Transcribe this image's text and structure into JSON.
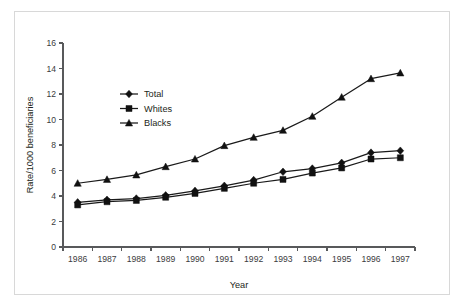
{
  "chart_data": {
    "type": "line",
    "title": "",
    "xlabel": "Year",
    "ylabel": "Rate/1000 beneficiaries",
    "categories": [
      "1986",
      "1987",
      "1988",
      "1989",
      "1990",
      "1991",
      "1992",
      "1993",
      "1994",
      "1995",
      "1996",
      "1997"
    ],
    "x": [
      1986,
      1987,
      1988,
      1989,
      1990,
      1991,
      1992,
      1993,
      1994,
      1995,
      1996,
      1997
    ],
    "xlim": [
      1985.5,
      1997.5
    ],
    "ylim": [
      0,
      16
    ],
    "yticks": [
      0,
      2,
      4,
      6,
      8,
      10,
      12,
      14,
      16
    ],
    "ytick_labels": [
      "0",
      "2",
      "4",
      "6",
      "8",
      "10",
      "12",
      "14",
      "16"
    ],
    "grid": false,
    "legend_position": "upper-left-inside",
    "series": [
      {
        "name": "Total",
        "marker": "diamond",
        "color": "#111111",
        "values": [
          3.5,
          3.7,
          3.8,
          4.05,
          4.4,
          4.8,
          5.25,
          5.9,
          6.15,
          6.6,
          7.4,
          7.55
        ]
      },
      {
        "name": "Whites",
        "marker": "square",
        "color": "#111111",
        "values": [
          3.3,
          3.55,
          3.65,
          3.9,
          4.2,
          4.6,
          5.0,
          5.3,
          5.8,
          6.2,
          6.9,
          7.0
        ]
      },
      {
        "name": "Blacks",
        "marker": "triangle",
        "color": "#111111",
        "values": [
          5.0,
          5.3,
          5.65,
          6.3,
          6.9,
          7.95,
          8.6,
          9.15,
          10.25,
          11.75,
          13.2,
          13.65
        ]
      }
    ]
  },
  "legend": {
    "items": [
      {
        "label": "Total",
        "marker": "diamond"
      },
      {
        "label": "Whites",
        "marker": "square"
      },
      {
        "label": "Blacks",
        "marker": "triangle"
      }
    ]
  },
  "axes": {
    "x_title": "Year",
    "y_title": "Rate/1000 beneficiaries"
  },
  "colors": {
    "ink": "#111111",
    "axis": "#58595b",
    "frame": "#d8d8d8",
    "background": "#ffffff"
  }
}
